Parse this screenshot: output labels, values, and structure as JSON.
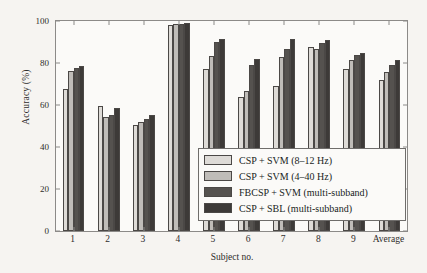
{
  "chart_data": {
    "type": "bar",
    "title": "",
    "xlabel": "Subject no.",
    "ylabel": "Accuracy (%)",
    "ylim": [
      0,
      100
    ],
    "yticks": [
      0,
      20,
      40,
      60,
      80,
      100
    ],
    "grid": false,
    "legend_position": "lower right (inside axes)",
    "categories": [
      "1",
      "2",
      "3",
      "4",
      "5",
      "6",
      "7",
      "8",
      "9",
      "Average"
    ],
    "series": [
      {
        "name": "CSP + SVM (8–12 Hz)",
        "color": "#dedbd7",
        "values": [
          67.5,
          59.3,
          50.3,
          98.2,
          77.0,
          63.8,
          69.0,
          87.6,
          77.0,
          72.0
        ]
      },
      {
        "name": "CSP + SVM (4–40 Hz)",
        "color": "#bfbcb8",
        "values": [
          76.0,
          54.5,
          51.7,
          98.4,
          83.2,
          66.8,
          83.1,
          86.7,
          81.6,
          75.7
        ]
      },
      {
        "name": "FBCSP + SVM (multi-subband)",
        "color": "#55524f",
        "values": [
          77.4,
          55.4,
          53.4,
          98.6,
          90.1,
          79.0,
          86.9,
          89.3,
          83.6,
          79.2
        ]
      },
      {
        "name": "CSP + SBL (multi-subband)",
        "color": "#3d3a38",
        "values": [
          78.6,
          58.8,
          55.1,
          99.0,
          91.4,
          81.8,
          91.4,
          91.0,
          84.9,
          81.2
        ]
      }
    ]
  },
  "legend": {
    "entries": [
      "CSP + SVM (8–12 Hz)",
      "CSP + SVM (4–40 Hz)",
      "FBCSP + SVM (multi-subband)",
      "CSP + SBL (multi-subband)"
    ]
  },
  "axes": {
    "y_tick_labels": [
      "0",
      "20",
      "40",
      "60",
      "80",
      "100"
    ],
    "x_tick_labels": [
      "1",
      "2",
      "3",
      "4",
      "5",
      "6",
      "7",
      "8",
      "9",
      "Average"
    ]
  },
  "colors": {
    "background": "#f6f4f1",
    "plot_background": "#fbfaf8",
    "axis": "#8c8a88",
    "text": "#2e2c2b",
    "bar_edge": "#4b4846"
  }
}
